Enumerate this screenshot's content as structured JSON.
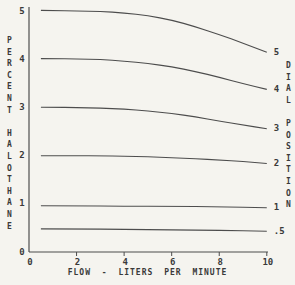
{
  "colors": {
    "background": "#f5f4ef",
    "line": "#4d4d4d",
    "text": "#3a3a3a"
  },
  "chart_data": {
    "type": "line",
    "title": "",
    "xlabel": "FLOW - LITERS PER MINUTE",
    "ylabel": "PERCENT HALOTHANE",
    "right_axis_label": "DIAL POSITION",
    "xlim": [
      0,
      10.05
    ],
    "ylim": [
      0,
      5.05
    ],
    "xticks": [
      0,
      2,
      4,
      6,
      8,
      10
    ],
    "yticks": [
      0,
      1,
      2,
      3,
      4,
      5
    ],
    "grid": false,
    "legend_position": "right-end-labels",
    "series": [
      {
        "dial_position": "5",
        "points": [
          [
            0.5,
            5.02
          ],
          [
            1,
            5.02
          ],
          [
            2,
            5.01
          ],
          [
            3,
            5.0
          ],
          [
            4,
            4.97
          ],
          [
            5,
            4.91
          ],
          [
            6,
            4.82
          ],
          [
            7,
            4.68
          ],
          [
            8,
            4.52
          ],
          [
            9,
            4.34
          ],
          [
            10,
            4.15
          ]
        ]
      },
      {
        "dial_position": "4",
        "points": [
          [
            0.5,
            4.02
          ],
          [
            1,
            4.02
          ],
          [
            2,
            4.01
          ],
          [
            3,
            4.0
          ],
          [
            4,
            3.97
          ],
          [
            5,
            3.92
          ],
          [
            6,
            3.85
          ],
          [
            7,
            3.75
          ],
          [
            8,
            3.63
          ],
          [
            9,
            3.5
          ],
          [
            10,
            3.38
          ]
        ]
      },
      {
        "dial_position": "3",
        "points": [
          [
            0.5,
            3.01
          ],
          [
            1,
            3.01
          ],
          [
            2,
            3.0
          ],
          [
            3,
            2.99
          ],
          [
            4,
            2.97
          ],
          [
            5,
            2.93
          ],
          [
            6,
            2.88
          ],
          [
            7,
            2.81
          ],
          [
            8,
            2.72
          ],
          [
            9,
            2.64
          ],
          [
            10,
            2.56
          ]
        ]
      },
      {
        "dial_position": "2",
        "points": [
          [
            0.5,
            2.0
          ],
          [
            1,
            2.0
          ],
          [
            2,
            2.0
          ],
          [
            3,
            2.0
          ],
          [
            4,
            1.99
          ],
          [
            5,
            1.98
          ],
          [
            6,
            1.96
          ],
          [
            7,
            1.94
          ],
          [
            8,
            1.91
          ],
          [
            9,
            1.88
          ],
          [
            10,
            1.84
          ]
        ]
      },
      {
        "dial_position": "1",
        "points": [
          [
            0.5,
            0.96
          ],
          [
            2,
            0.96
          ],
          [
            4,
            0.95
          ],
          [
            6,
            0.95
          ],
          [
            8,
            0.94
          ],
          [
            10,
            0.92
          ]
        ]
      },
      {
        "dial_position": ".5",
        "points": [
          [
            0.5,
            0.48
          ],
          [
            2,
            0.48
          ],
          [
            4,
            0.47
          ],
          [
            6,
            0.46
          ],
          [
            8,
            0.45
          ],
          [
            10,
            0.43
          ]
        ]
      }
    ]
  }
}
